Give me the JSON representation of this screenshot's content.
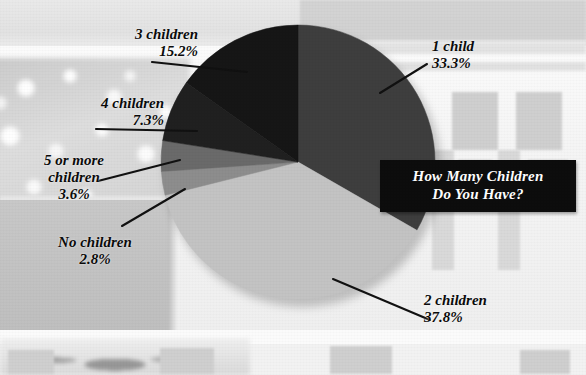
{
  "title": {
    "line1": "How Many Children",
    "line2": "Do You Have?",
    "text": "How Many Children\nDo You Have?",
    "background_color": "#0d0d0d",
    "text_color": "#ffffff"
  },
  "labels": {
    "one_child": "1 child\n33.3%",
    "two_children": "2 children\n37.8%",
    "three_children": "3 children\n15.2%",
    "four_children": "4 children\n7.3%",
    "five_or_more": "5 or more\nchildren\n3.6%",
    "no_children": "No children\n2.8%"
  },
  "chart_data": {
    "type": "pie",
    "title": "How Many Children Do You Have?",
    "categories": [
      "1 child",
      "2 children",
      "3 children",
      "4 children",
      "5 or more children",
      "No children"
    ],
    "values": [
      33.3,
      37.8,
      15.2,
      7.3,
      3.6,
      2.8
    ],
    "value_labels": [
      "33.3%",
      "37.8%",
      "15.2%",
      "7.3%",
      "3.6%",
      "2.8%"
    ],
    "units": "percent",
    "total": 100.0,
    "start_angle_deg": 0,
    "direction": "clockwise",
    "legend": "none",
    "labels_position": "outside-with-leader-lines",
    "grid": false,
    "slice_colors": [
      "#3e3e3e",
      "#c3c3c3",
      "#161616",
      "#202020",
      "#6a6a6a",
      "#8d8d8d"
    ],
    "slices": [
      {
        "name": "1 child",
        "value": 33.3,
        "label": "1 child\n33.3%",
        "color": "#3e3e3e"
      },
      {
        "name": "2 children",
        "value": 37.8,
        "label": "2 children\n37.8%",
        "color": "#c3c3c3"
      },
      {
        "name": "No children",
        "value": 2.8,
        "label": "No children\n2.8%",
        "color": "#8d8d8d"
      },
      {
        "name": "5 or more children",
        "value": 3.6,
        "label": "5 or more\nchildren\n3.6%",
        "color": "#6a6a6a"
      },
      {
        "name": "4 children",
        "value": 7.3,
        "label": "4 children\n7.3%",
        "color": "#202020"
      },
      {
        "name": "3 children",
        "value": 15.2,
        "label": "3 children\n15.2%",
        "color": "#161616"
      }
    ]
  }
}
